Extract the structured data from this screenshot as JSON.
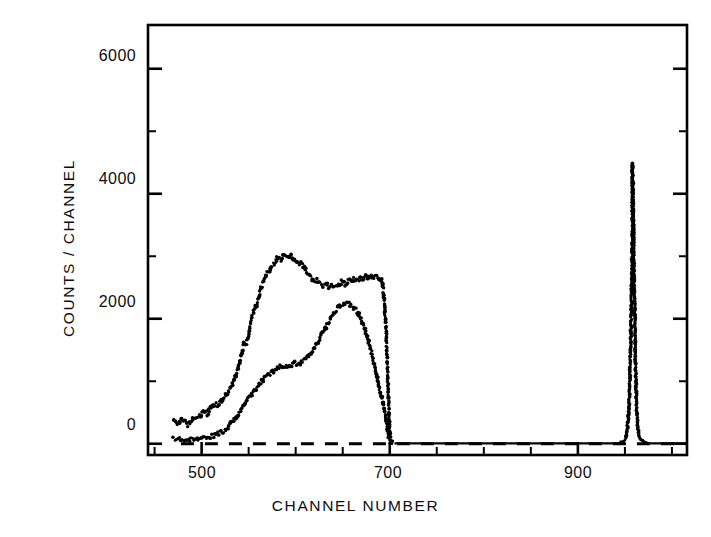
{
  "chart_data": {
    "type": "scatter",
    "title": "",
    "xlabel": "CHANNEL  NUMBER",
    "ylabel": "COUNTS / CHANNEL",
    "xlim": [
      443,
      1016
    ],
    "ylim": [
      -180,
      6700
    ],
    "grid": false,
    "legend": null,
    "x_major_ticks": [
      500,
      700,
      900
    ],
    "x_major_tick_labels": [
      "500",
      "700",
      "900"
    ],
    "x_minor_ticks": [
      450,
      550,
      600,
      650,
      750,
      800,
      850,
      950,
      1000
    ],
    "y_major_ticks": [
      0,
      2000,
      4000,
      6000
    ],
    "y_major_tick_labels": [
      "0",
      "2000",
      "4000",
      "6000"
    ],
    "y_minor_ticks": [
      1000,
      3000,
      5000
    ],
    "baseline": {
      "label": "zero-level",
      "y": 0,
      "x_start": 478,
      "x_end": 1016,
      "style": "dashed"
    },
    "series": [
      {
        "name": "upper-spectrum",
        "marker": "dot",
        "points": [
          [
            470,
            370
          ],
          [
            473,
            330
          ],
          [
            476,
            300
          ],
          [
            479,
            420
          ],
          [
            482,
            355
          ],
          [
            485,
            300
          ],
          [
            488,
            345
          ],
          [
            491,
            400
          ],
          [
            494,
            375
          ],
          [
            497,
            430
          ],
          [
            500,
            470
          ],
          [
            503,
            520
          ],
          [
            506,
            480
          ],
          [
            509,
            560
          ],
          [
            512,
            600
          ],
          [
            515,
            640
          ],
          [
            518,
            610
          ],
          [
            521,
            700
          ],
          [
            524,
            760
          ],
          [
            527,
            800
          ],
          [
            530,
            880
          ],
          [
            533,
            960
          ],
          [
            536,
            1080
          ],
          [
            539,
            1230
          ],
          [
            542,
            1400
          ],
          [
            545,
            1600
          ],
          [
            548,
            1620
          ],
          [
            551,
            1860
          ],
          [
            554,
            2050
          ],
          [
            557,
            2180
          ],
          [
            560,
            2300
          ],
          [
            563,
            2480
          ],
          [
            566,
            2600
          ],
          [
            569,
            2700
          ],
          [
            572,
            2760
          ],
          [
            575,
            2840
          ],
          [
            578,
            2900
          ],
          [
            581,
            2980
          ],
          [
            584,
            2940
          ],
          [
            587,
            3020
          ],
          [
            590,
            3000
          ],
          [
            593,
            2960
          ],
          [
            596,
            3010
          ],
          [
            599,
            2940
          ],
          [
            602,
            2880
          ],
          [
            605,
            2900
          ],
          [
            608,
            2840
          ],
          [
            611,
            2780
          ],
          [
            614,
            2720
          ],
          [
            617,
            2660
          ],
          [
            620,
            2600
          ],
          [
            623,
            2620
          ],
          [
            626,
            2560
          ],
          [
            629,
            2540
          ],
          [
            632,
            2560
          ],
          [
            635,
            2520
          ],
          [
            638,
            2540
          ],
          [
            641,
            2500
          ],
          [
            644,
            2520
          ],
          [
            647,
            2560
          ],
          [
            650,
            2600
          ],
          [
            653,
            2560
          ],
          [
            656,
            2620
          ],
          [
            659,
            2600
          ],
          [
            662,
            2640
          ],
          [
            665,
            2600
          ],
          [
            668,
            2660
          ],
          [
            671,
            2620
          ],
          [
            674,
            2680
          ],
          [
            677,
            2640
          ],
          [
            680,
            2700
          ],
          [
            683,
            2660
          ],
          [
            686,
            2680
          ],
          [
            689,
            2640
          ],
          [
            692,
            2600
          ],
          [
            694,
            2300
          ],
          [
            696,
            1900
          ],
          [
            697,
            1450
          ],
          [
            698,
            1050
          ],
          [
            699,
            600
          ],
          [
            700,
            180
          ],
          [
            701,
            40
          ],
          [
            703,
            10
          ]
        ]
      },
      {
        "name": "lower-spectrum",
        "marker": "dot",
        "points": [
          [
            470,
            75
          ],
          [
            474,
            70
          ],
          [
            478,
            68
          ],
          [
            482,
            70
          ],
          [
            486,
            72
          ],
          [
            490,
            75
          ],
          [
            494,
            80
          ],
          [
            498,
            85
          ],
          [
            502,
            92
          ],
          [
            506,
            100
          ],
          [
            510,
            115
          ],
          [
            514,
            135
          ],
          [
            518,
            160
          ],
          [
            522,
            195
          ],
          [
            526,
            240
          ],
          [
            530,
            300
          ],
          [
            534,
            370
          ],
          [
            538,
            450
          ],
          [
            542,
            540
          ],
          [
            546,
            630
          ],
          [
            550,
            720
          ],
          [
            554,
            800
          ],
          [
            558,
            880
          ],
          [
            562,
            960
          ],
          [
            566,
            1030
          ],
          [
            570,
            1090
          ],
          [
            574,
            1140
          ],
          [
            578,
            1180
          ],
          [
            582,
            1220
          ],
          [
            586,
            1240
          ],
          [
            590,
            1230
          ],
          [
            594,
            1260
          ],
          [
            598,
            1290
          ],
          [
            602,
            1270
          ],
          [
            606,
            1300
          ],
          [
            610,
            1340
          ],
          [
            614,
            1420
          ],
          [
            618,
            1500
          ],
          [
            622,
            1600
          ],
          [
            626,
            1700
          ],
          [
            630,
            1810
          ],
          [
            634,
            1920
          ],
          [
            638,
            2030
          ],
          [
            642,
            2130
          ],
          [
            646,
            2200
          ],
          [
            650,
            2240
          ],
          [
            654,
            2250
          ],
          [
            658,
            2230
          ],
          [
            662,
            2180
          ],
          [
            666,
            2100
          ],
          [
            670,
            1980
          ],
          [
            674,
            1820
          ],
          [
            678,
            1620
          ],
          [
            682,
            1380
          ],
          [
            686,
            1100
          ],
          [
            690,
            820
          ],
          [
            693,
            640
          ],
          [
            695,
            500
          ],
          [
            696,
            420
          ],
          [
            697,
            330
          ],
          [
            698,
            210
          ],
          [
            699,
            110
          ],
          [
            700,
            40
          ],
          [
            702,
            12
          ],
          [
            705,
            8
          ]
        ]
      },
      {
        "name": "calibration-peak",
        "marker": "dot",
        "points": [
          [
            946,
            20
          ],
          [
            949,
            40
          ],
          [
            951,
            90
          ],
          [
            952,
            180
          ],
          [
            953,
            330
          ],
          [
            954,
            520
          ],
          [
            955,
            900
          ],
          [
            956,
            1500
          ],
          [
            957,
            2400
          ],
          [
            958,
            3400
          ],
          [
            958,
            4480
          ],
          [
            959,
            3700
          ],
          [
            960,
            2500
          ],
          [
            961,
            1500
          ],
          [
            962,
            800
          ],
          [
            963,
            420
          ],
          [
            964,
            230
          ],
          [
            965,
            130
          ],
          [
            967,
            60
          ],
          [
            970,
            25
          ],
          [
            974,
            10
          ]
        ]
      }
    ],
    "flat_segments": [
      {
        "name": "flat-right-of-700",
        "x_start": 705,
        "x_end": 944,
        "y": 6
      },
      {
        "name": "flat-right-of-peak",
        "x_start": 974,
        "x_end": 1016,
        "y": 6
      }
    ]
  },
  "figure": {
    "name": "counts-per-channel-spectrum",
    "frame": {
      "ticks_inward": true,
      "mirrored_ticks": true
    }
  }
}
